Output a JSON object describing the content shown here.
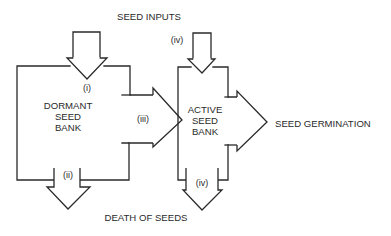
{
  "diagram": {
    "type": "flow",
    "colors": {
      "stroke": "#2a2a2a",
      "background": "#ffffff"
    },
    "nodes": {
      "dormant": {
        "line1": "DORMANT",
        "line2": "SEED",
        "line3": "BANK"
      },
      "active": {
        "line1": "ACTIVE",
        "line2": "SEED",
        "line3": "BANK"
      }
    },
    "labels": {
      "seed_inputs": "SEED INPUTS",
      "seed_germination": "SEED GERMINATION",
      "death_of_seeds": "DEATH OF SEEDS"
    },
    "flow_markers": {
      "i": "(i)",
      "ii": "(ii)",
      "iii": "(iii)",
      "iv_top": "(iv)",
      "iv_bottom": "(iv)"
    },
    "flows": [
      {
        "id": "i",
        "from": "SEED INPUTS",
        "to": "DORMANT SEED BANK"
      },
      {
        "id": "ii",
        "from": "DORMANT SEED BANK",
        "to": "DEATH OF SEEDS"
      },
      {
        "id": "iii",
        "from": "DORMANT SEED BANK",
        "to": "ACTIVE SEED BANK"
      },
      {
        "id": "iv",
        "from": "SEED INPUTS",
        "to": "ACTIVE SEED BANK"
      },
      {
        "id": "iv",
        "from": "ACTIVE SEED BANK",
        "to": "DEATH OF SEEDS"
      },
      {
        "id": "germination",
        "from": "ACTIVE SEED BANK",
        "to": "SEED GERMINATION"
      }
    ]
  }
}
